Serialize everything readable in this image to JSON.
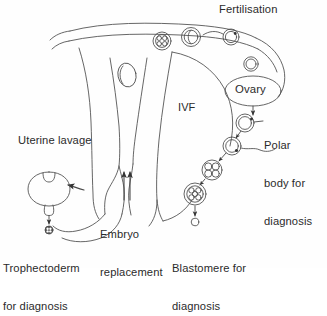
{
  "figure": {
    "type": "biomedical-flow-diagram",
    "background_color": "#fefefe",
    "line_color": "#3a3a3a",
    "text_color": "#2b2b2b"
  },
  "labels": {
    "fertilisation": "Fertilisation",
    "ovary": "Ovary",
    "ivf": "IVF",
    "polar_body": {
      "line1": "Polar",
      "line2": "body for",
      "line3": "diagnosis"
    },
    "uterine_lavage": "Uterine lavage",
    "embryo_replacement": {
      "line1": "Embryo",
      "line2": "replacement"
    },
    "trophectoderm": {
      "line1": "Trophectoderm",
      "line2": "for diagnosis"
    },
    "blastomere": {
      "line1": "Blastomere for",
      "line2": "diagnosis"
    }
  },
  "structures": {
    "uterus": "uterus-and-fallopian-tubes-outline",
    "ovary_ellipse": "ovary-ellipse",
    "blastocyst": "blastocyst-with-herniating-trophectoderm",
    "left_ovary_small": "small-ovary-outline-left"
  },
  "cells": [
    {
      "name": "morula-in-tube-left",
      "stage": "morula",
      "cx": 162,
      "cy": 41,
      "r": 9
    },
    {
      "name": "two-cell-in-tube",
      "stage": "two-cell",
      "cx": 191,
      "cy": 37,
      "r": 9
    },
    {
      "name": "fertilising-oocyte",
      "stage": "fertilisation",
      "cx": 231,
      "cy": 37,
      "r": 8
    },
    {
      "name": "released-oocyte",
      "stage": "oocyte",
      "cx": 251,
      "cy": 64,
      "r": 7
    },
    {
      "name": "ovulated-oocyte-with-polar-body",
      "stage": "oocyte",
      "cx": 245,
      "cy": 123,
      "r": 9
    },
    {
      "name": "zygote-with-polar-body",
      "stage": "zygote",
      "cx": 232,
      "cy": 145,
      "r": 9
    },
    {
      "name": "four-cell-embryo",
      "stage": "four-cell",
      "cx": 213,
      "cy": 170,
      "r": 10
    },
    {
      "name": "morula-for-biopsy",
      "stage": "morula",
      "cx": 196,
      "cy": 194,
      "r": 11
    },
    {
      "name": "biopsied-blastomere",
      "stage": "single-cell",
      "cx": 196,
      "cy": 222,
      "r": 4
    },
    {
      "name": "trophectoderm-sample",
      "stage": "cell-cluster",
      "cx": 47,
      "cy": 224,
      "r": 4
    }
  ],
  "arrows": [
    {
      "name": "ovary-to-oocyte-arrow",
      "from": "ovary-ellipse",
      "to": "ovulated-oocyte"
    },
    {
      "name": "polar-body-leader-line",
      "from": "ovulated-oocyte",
      "to": "polar-body-label"
    },
    {
      "name": "oocyte-to-zygote-arrow",
      "from": "ovulated-oocyte",
      "to": "zygote"
    },
    {
      "name": "zygote-to-four-cell-arrow",
      "from": "zygote",
      "to": "four-cell-embryo"
    },
    {
      "name": "four-cell-to-morula-arrow",
      "from": "four-cell-embryo",
      "to": "morula-for-biopsy"
    },
    {
      "name": "blastomere-biopsy-arrow",
      "from": "morula-for-biopsy",
      "to": "biopsied-blastomere"
    },
    {
      "name": "embryo-replacement-arrows",
      "from": "morula-for-biopsy",
      "to": "uterine-cavity"
    },
    {
      "name": "uterine-lavage-arrow",
      "from": "uterus",
      "to": "blastocyst"
    },
    {
      "name": "trophectoderm-biopsy-arrow",
      "from": "blastocyst",
      "to": "trophectoderm-sample"
    }
  ]
}
